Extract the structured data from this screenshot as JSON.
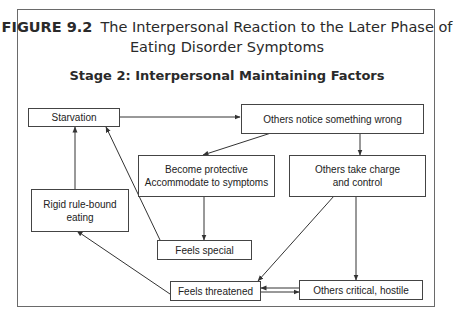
{
  "figure": {
    "label": "FIGURE 9.2",
    "title_line1": "The Interpersonal Reaction to the Later Phase of",
    "title_line2": "Eating Disorder Symptoms",
    "subtitle": "Stage 2: Interpersonal Maintaining Factors"
  },
  "nodes": {
    "starvation": "Starvation",
    "others_notice": "Others notice something wrong",
    "become_protective_l1": "Become protective",
    "become_protective_l2": "Accommodate to symptoms",
    "others_take_charge_l1": "Others take charge",
    "others_take_charge_l2": "and control",
    "rigid_l1": "Rigid rule-bound",
    "rigid_l2": "eating",
    "feels_special": "Feels special",
    "feels_threatened": "Feels threatened",
    "others_critical": "Others critical, hostile"
  },
  "edges": [
    {
      "from": "Starvation",
      "to": "Others notice something wrong"
    },
    {
      "from": "Others notice something wrong",
      "to": "Become protective / Accommodate to symptoms"
    },
    {
      "from": "Others notice something wrong",
      "to": "Others take charge and control"
    },
    {
      "from": "Become protective / Accommodate to symptoms",
      "to": "Feels special"
    },
    {
      "from": "Feels special",
      "to": "Starvation"
    },
    {
      "from": "Rigid rule-bound eating",
      "to": "Starvation"
    },
    {
      "from": "Feels threatened",
      "to": "Rigid rule-bound eating"
    },
    {
      "from": "Others take charge and control",
      "to": "Feels threatened"
    },
    {
      "from": "Others take charge and control",
      "to": "Others critical, hostile"
    },
    {
      "from": "Feels threatened",
      "to": "Others critical, hostile"
    },
    {
      "from": "Others critical, hostile",
      "to": "Feels threatened"
    }
  ]
}
